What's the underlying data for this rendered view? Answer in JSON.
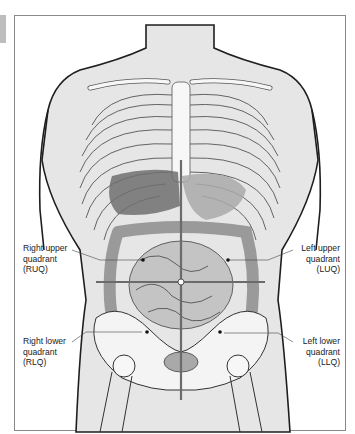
{
  "figure": {
    "labels": {
      "ruq": {
        "line1": "Right upper",
        "line2": "quadrant",
        "line3": "(RUQ)"
      },
      "luq": {
        "line1": "Left upper",
        "line2": "quadrant",
        "line3": "(LUQ)"
      },
      "rlq": {
        "line1": "Right lower",
        "line2": "quadrant",
        "line3": "(RLQ)"
      },
      "llq": {
        "line1": "Left lower",
        "line2": "quadrant",
        "line3": "(LLQ)"
      }
    },
    "colors": {
      "skin": "#e6e6e6",
      "bone": "#f7f7f7",
      "organ_dark": "#6f6f6f",
      "organ_mid": "#a9a9a9",
      "intestine": "#c4c4c4",
      "outline": "#1e1e1e",
      "quadrant_line": "#6b6b6b",
      "frame": "#8a8a8a"
    }
  }
}
